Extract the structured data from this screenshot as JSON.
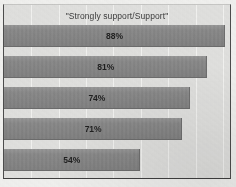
{
  "document": {
    "kind": "scanned-bar-chart",
    "clipped_top_text": "",
    "colors": {
      "bar_fill": "#8a8a8a",
      "plot_background": "#e2e2e0",
      "page_background": "#f2f2f0",
      "frame_border": "#4d4d4d",
      "gridline": "#f4f4f2",
      "label_text": "#1f1f1f",
      "title_text": "#3a3a3a"
    }
  },
  "chart_data": {
    "type": "bar",
    "orientation": "horizontal",
    "title": "\"Strongly support/Support\"",
    "xlabel": "",
    "ylabel": "",
    "xlim": [
      0,
      100
    ],
    "grid": true,
    "legend": "none",
    "categories": [
      "",
      "",
      "",
      "",
      ""
    ],
    "values": [
      88,
      81,
      74,
      71,
      54
    ],
    "value_labels": [
      "88%",
      "81%",
      "74%",
      "71%",
      "54%"
    ],
    "bars": [
      {
        "label": "88%",
        "value": 88
      },
      {
        "label": "81%",
        "value": 81
      },
      {
        "label": "74%",
        "value": 74
      },
      {
        "label": "71%",
        "value": 71
      },
      {
        "label": "54%",
        "value": 54
      }
    ],
    "gridline_positions": [
      12,
      24,
      36,
      48,
      60,
      72,
      84,
      96
    ]
  }
}
